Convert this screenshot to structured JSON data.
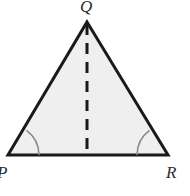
{
  "figure": {
    "kind": "geometry-diagram",
    "canvas": {
      "width": 190,
      "height": 196,
      "background": "#ffffff"
    },
    "triangle": {
      "name": "triangle-pqr",
      "fill": "#efefef",
      "stroke": "#1a1a1a",
      "stroke_width": 3,
      "points": "87,22 168,155 8,155",
      "vertices": [
        {
          "id": "P",
          "label": "P",
          "x": 8,
          "y": 155
        },
        {
          "id": "Q",
          "label": "Q",
          "x": 87,
          "y": 22
        },
        {
          "id": "R",
          "label": "R",
          "x": 168,
          "y": 155
        }
      ]
    },
    "altitude": {
      "name": "altitude-q-to-pr",
      "x1": 87,
      "y1": 24,
      "x2": 87,
      "y2": 155,
      "stroke": "#1a1a1a",
      "stroke_width": 3,
      "dash_pattern": "11 8"
    },
    "angle_arcs": [
      {
        "id": "angle-p",
        "at_vertex": "P",
        "stroke": "#8a8a8a",
        "stroke_width": 1.6,
        "radius": 31,
        "path": "M 39 155 A 31 31 0 0 0 26.5 130.4"
      },
      {
        "id": "angle-r",
        "at_vertex": "R",
        "stroke": "#8a8a8a",
        "stroke_width": 1.6,
        "radius": 31,
        "path": "M 137 155 A 31 31 0 0 1 149.5 130.4"
      }
    ],
    "labels": {
      "q": "Q",
      "p": "P",
      "r": "R"
    }
  }
}
